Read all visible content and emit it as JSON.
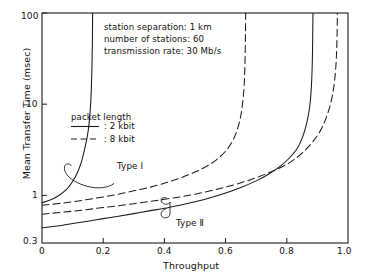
{
  "chart_data": {
    "type": "line",
    "title": "",
    "xlabel": "Throughput",
    "ylabel": "Mean Transfer Time (msec)",
    "xlim": [
      0,
      1.0
    ],
    "ylim": [
      0.3,
      100
    ],
    "yscale": "log",
    "xscale": "linear",
    "grid": false,
    "legend_position": "upper-left-inside",
    "xticks": [
      "0",
      "0.2",
      "0.4",
      "0.6",
      "0.8",
      "1.0"
    ],
    "xtick_values": [
      0,
      0.2,
      0.4,
      0.6,
      0.8,
      1.0
    ],
    "yticks": [
      "0.3",
      "1",
      "10",
      "100"
    ],
    "ytick_values": [
      0.3,
      1,
      10,
      100
    ],
    "annotations": [
      "station separation: 1 km",
      "number of stations: 60",
      "transmission rate: 30 Mb/s"
    ],
    "legend_title": "packet length",
    "legend": [
      {
        "label": ": 2 kbit",
        "style": "solid"
      },
      {
        "label": ": 8 kbit",
        "style": "dashed"
      }
    ],
    "curve_labels": [
      {
        "text": "Type I"
      },
      {
        "text": "Type Ⅱ"
      }
    ],
    "series": [
      {
        "name": "Type I, 2 kbit",
        "style": "solid",
        "asymptote_x": 0.165,
        "points": [
          [
            0.0,
            0.83
          ],
          [
            0.02,
            0.87
          ],
          [
            0.04,
            0.93
          ],
          [
            0.06,
            1.02
          ],
          [
            0.08,
            1.16
          ],
          [
            0.09,
            1.27
          ],
          [
            0.1,
            1.42
          ],
          [
            0.11,
            1.62
          ],
          [
            0.12,
            1.92
          ],
          [
            0.13,
            2.4
          ],
          [
            0.14,
            3.3
          ],
          [
            0.148,
            4.4
          ],
          [
            0.154,
            6.2
          ],
          [
            0.158,
            9.0
          ],
          [
            0.161,
            14.0
          ],
          [
            0.163,
            24.0
          ],
          [
            0.1645,
            45.0
          ],
          [
            0.1655,
            100.0
          ]
        ]
      },
      {
        "name": "Type I, 8 kbit",
        "style": "dashed",
        "asymptote_x": 0.665,
        "points": [
          [
            0.0,
            0.78
          ],
          [
            0.05,
            0.81
          ],
          [
            0.1,
            0.85
          ],
          [
            0.15,
            0.9
          ],
          [
            0.2,
            0.96
          ],
          [
            0.25,
            1.03
          ],
          [
            0.3,
            1.12
          ],
          [
            0.35,
            1.22
          ],
          [
            0.4,
            1.36
          ],
          [
            0.45,
            1.54
          ],
          [
            0.5,
            1.8
          ],
          [
            0.54,
            2.1
          ],
          [
            0.57,
            2.45
          ],
          [
            0.6,
            3.05
          ],
          [
            0.62,
            3.8
          ],
          [
            0.635,
            4.9
          ],
          [
            0.648,
            7.0
          ],
          [
            0.656,
            10.5
          ],
          [
            0.661,
            17.0
          ],
          [
            0.6635,
            30.0
          ],
          [
            0.6648,
            55.0
          ],
          [
            0.6655,
            100.0
          ]
        ]
      },
      {
        "name": "Type II, 2 kbit",
        "style": "solid",
        "asymptote_x": 0.885,
        "points": [
          [
            0.0,
            0.44
          ],
          [
            0.05,
            0.46
          ],
          [
            0.1,
            0.49
          ],
          [
            0.15,
            0.52
          ],
          [
            0.2,
            0.555
          ],
          [
            0.25,
            0.59
          ],
          [
            0.3,
            0.63
          ],
          [
            0.35,
            0.675
          ],
          [
            0.4,
            0.72
          ],
          [
            0.45,
            0.78
          ],
          [
            0.5,
            0.85
          ],
          [
            0.55,
            0.94
          ],
          [
            0.6,
            1.06
          ],
          [
            0.65,
            1.22
          ],
          [
            0.7,
            1.44
          ],
          [
            0.74,
            1.7
          ],
          [
            0.78,
            2.1
          ],
          [
            0.81,
            2.6
          ],
          [
            0.835,
            3.3
          ],
          [
            0.852,
            4.4
          ],
          [
            0.866,
            6.4
          ],
          [
            0.875,
            9.5
          ],
          [
            0.88,
            15.0
          ],
          [
            0.883,
            26.0
          ],
          [
            0.8845,
            50.0
          ],
          [
            0.8855,
            100.0
          ]
        ]
      },
      {
        "name": "Type II, 8 kbit",
        "style": "dashed",
        "asymptote_x": 0.965,
        "points": [
          [
            0.0,
            0.62
          ],
          [
            0.05,
            0.645
          ],
          [
            0.1,
            0.67
          ],
          [
            0.15,
            0.7
          ],
          [
            0.2,
            0.735
          ],
          [
            0.25,
            0.77
          ],
          [
            0.3,
            0.81
          ],
          [
            0.35,
            0.855
          ],
          [
            0.4,
            0.905
          ],
          [
            0.45,
            0.96
          ],
          [
            0.5,
            1.03
          ],
          [
            0.55,
            1.12
          ],
          [
            0.6,
            1.23
          ],
          [
            0.65,
            1.37
          ],
          [
            0.7,
            1.56
          ],
          [
            0.75,
            1.82
          ],
          [
            0.79,
            2.1
          ],
          [
            0.82,
            2.42
          ],
          [
            0.85,
            2.9
          ],
          [
            0.88,
            3.7
          ],
          [
            0.905,
            4.8
          ],
          [
            0.925,
            6.6
          ],
          [
            0.942,
            9.8
          ],
          [
            0.953,
            15.0
          ],
          [
            0.96,
            25.0
          ],
          [
            0.9635,
            45.0
          ],
          [
            0.9655,
            100.0
          ]
        ]
      }
    ]
  },
  "layout": {
    "plot_left": 42,
    "plot_right": 348,
    "plot_top": 13,
    "plot_bottom": 243
  }
}
